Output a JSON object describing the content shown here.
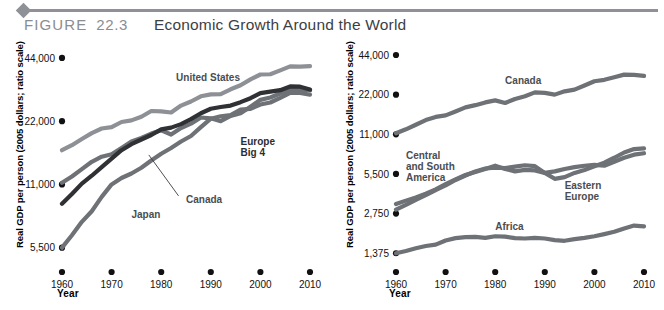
{
  "figure": {
    "label_word": "FIGURE",
    "number": "22.3",
    "title": "Economic Growth Around the World"
  },
  "chart_data": [
    {
      "id": "left",
      "type": "line",
      "title": "",
      "xlabel": "Year",
      "ylabel": "Real GDP per person (2005 dollars; ratio scale)",
      "xticks": [
        "1960",
        "1970",
        "1980",
        "1990",
        "2000",
        "2010"
      ],
      "xlim": [
        1960,
        2010
      ],
      "yticks": [
        "5,500",
        "11,000",
        "22,000",
        "44,000"
      ],
      "ytickvalues": [
        5500,
        11000,
        22000,
        44000
      ],
      "ylim": [
        4700,
        48000
      ],
      "yscale": "log",
      "grid": false,
      "legend": "inline-labels",
      "series": [
        {
          "name": "United States",
          "color": "#8d9095",
          "label_x": 1983,
          "label_y": 34000,
          "x": [
            1960,
            1962,
            1964,
            1966,
            1968,
            1970,
            1972,
            1974,
            1976,
            1978,
            1980,
            1982,
            1984,
            1986,
            1988,
            1990,
            1992,
            1994,
            1996,
            1998,
            2000,
            2002,
            2004,
            2006,
            2008,
            2010
          ],
          "values": [
            16000,
            16900,
            18100,
            19300,
            20300,
            20600,
            21800,
            22200,
            23100,
            24600,
            24500,
            24200,
            26100,
            27300,
            28900,
            29500,
            29600,
            31200,
            32600,
            34800,
            36700,
            36800,
            38400,
            40100,
            40000,
            40200
          ]
        },
        {
          "name": "Canada",
          "color": "#6e7276",
          "label_x": 1985,
          "label_y": 9000,
          "leader": {
            "x1": 1983.5,
            "y1": 9700,
            "x2": 1977.5,
            "y2": 15200
          },
          "x": [
            1960,
            1962,
            1964,
            1966,
            1968,
            1970,
            1972,
            1974,
            1976,
            1978,
            1980,
            1982,
            1984,
            1986,
            1988,
            1990,
            1992,
            1994,
            1996,
            1998,
            2000,
            2002,
            2004,
            2006,
            2008,
            2010
          ],
          "values": [
            11200,
            12000,
            13000,
            14100,
            14900,
            15300,
            16400,
            17600,
            18300,
            19200,
            19900,
            19000,
            20400,
            21400,
            22900,
            22700,
            22000,
            23300,
            24000,
            25800,
            27800,
            28500,
            29800,
            31200,
            31100,
            30800
          ]
        },
        {
          "name": "Europe Big 4",
          "color": "#2f3134",
          "label_x": 1996,
          "label_y": 17000,
          "label_lines": [
            "Europe",
            "Big 4"
          ],
          "x": [
            1960,
            1962,
            1964,
            1966,
            1968,
            1970,
            1972,
            1974,
            1976,
            1978,
            1980,
            1982,
            1984,
            1986,
            1988,
            1990,
            1992,
            1994,
            1996,
            1998,
            2000,
            2002,
            2004,
            2006,
            2008,
            2010
          ],
          "values": [
            8900,
            9900,
            11100,
            12100,
            13300,
            14600,
            16000,
            17100,
            18000,
            18900,
            20100,
            20500,
            21300,
            22500,
            24000,
            25200,
            25700,
            26100,
            27100,
            28300,
            29900,
            30400,
            30900,
            32200,
            32100,
            31100
          ]
        },
        {
          "name": "Japan",
          "color": "#6e7276",
          "label_x": 1974,
          "label_y": 7600,
          "x": [
            1960,
            1962,
            1964,
            1966,
            1968,
            1970,
            1972,
            1974,
            1976,
            1978,
            1980,
            1982,
            1984,
            1986,
            1988,
            1990,
            1992,
            1994,
            1996,
            1998,
            2000,
            2002,
            2004,
            2006,
            2008,
            2010
          ],
          "values": [
            5500,
            6300,
            7300,
            8200,
            9600,
            11000,
            11800,
            12400,
            13200,
            14300,
            15400,
            16400,
            17600,
            18700,
            20600,
            22600,
            23200,
            23500,
            25000,
            25200,
            26400,
            27000,
            28400,
            30000,
            30000,
            29400
          ]
        }
      ]
    },
    {
      "id": "right",
      "type": "line",
      "title": "",
      "xlabel": "Year",
      "ylabel": "Real GDP per person (2005 dollars; ratio scale)",
      "xticks": [
        "1960",
        "1970",
        "1980",
        "1990",
        "2000",
        "2010"
      ],
      "xlim": [
        1960,
        2010
      ],
      "yticks": [
        "1,375",
        "2,750",
        "5,500",
        "11,000",
        "22,000",
        "44,000"
      ],
      "ytickvalues": [
        1375,
        2750,
        5500,
        11000,
        22000,
        44000
      ],
      "ylim": [
        1180,
        48000
      ],
      "yscale": "log",
      "grid": false,
      "legend": "inline-labels",
      "series": [
        {
          "name": "Canada",
          "color": "#6e7276",
          "label_x": 1982,
          "label_y": 26500,
          "x": [
            1960,
            1962,
            1964,
            1966,
            1968,
            1970,
            1972,
            1974,
            1976,
            1978,
            1980,
            1982,
            1984,
            1986,
            1988,
            1990,
            1992,
            1994,
            1996,
            1998,
            2000,
            2002,
            2004,
            2006,
            2008,
            2010
          ],
          "values": [
            11200,
            12000,
            13000,
            14100,
            14900,
            15300,
            16400,
            17600,
            18300,
            19200,
            19900,
            19000,
            20400,
            21400,
            22900,
            22700,
            22000,
            23300,
            24000,
            25800,
            27800,
            28500,
            29800,
            31200,
            31100,
            30500
          ]
        },
        {
          "name": "Central and South America",
          "color": "#6e7276",
          "label_x": 1962,
          "label_y": 7200,
          "label_lines": [
            "Central",
            "and South",
            "America"
          ],
          "x": [
            1960,
            1962,
            1964,
            1966,
            1968,
            1970,
            1972,
            1974,
            1976,
            1978,
            1980,
            1982,
            1984,
            1986,
            1988,
            1990,
            1992,
            1994,
            1996,
            1998,
            2000,
            2002,
            2004,
            2006,
            2008,
            2010
          ],
          "values": [
            3250,
            3450,
            3650,
            3900,
            4200,
            4600,
            5000,
            5400,
            5700,
            6000,
            6350,
            6000,
            5750,
            5900,
            5850,
            5600,
            5750,
            6000,
            6200,
            6350,
            6450,
            6350,
            6800,
            7300,
            7700,
            7900
          ]
        },
        {
          "name": "Eastern Europe",
          "color": "#6e7276",
          "label_x": 1994,
          "label_y": 4200,
          "label_lines": [
            "Eastern",
            "Europe"
          ],
          "x": [
            1960,
            1962,
            1964,
            1966,
            1968,
            1970,
            1972,
            1974,
            1976,
            1978,
            1980,
            1982,
            1984,
            1986,
            1988,
            1990,
            1992,
            1994,
            1996,
            1998,
            2000,
            2002,
            2004,
            2006,
            2008,
            2010
          ],
          "values": [
            2950,
            3200,
            3500,
            3800,
            4150,
            4500,
            4950,
            5350,
            5750,
            6050,
            6150,
            6100,
            6250,
            6400,
            6300,
            5600,
            5050,
            5200,
            5600,
            5900,
            6300,
            6700,
            7300,
            8000,
            8500,
            8600
          ]
        },
        {
          "name": "Africa",
          "color": "#6e7276",
          "label_x": 1980,
          "label_y": 2050,
          "x": [
            1960,
            1962,
            1964,
            1966,
            1968,
            1970,
            1972,
            1974,
            1976,
            1978,
            1980,
            1982,
            1984,
            1986,
            1988,
            1990,
            1992,
            1994,
            1996,
            1998,
            2000,
            2002,
            2004,
            2006,
            2008,
            2010
          ],
          "values": [
            1375,
            1430,
            1500,
            1560,
            1600,
            1720,
            1790,
            1820,
            1830,
            1800,
            1850,
            1840,
            1790,
            1780,
            1800,
            1780,
            1730,
            1710,
            1760,
            1800,
            1850,
            1920,
            2000,
            2120,
            2230,
            2200
          ]
        }
      ]
    }
  ]
}
